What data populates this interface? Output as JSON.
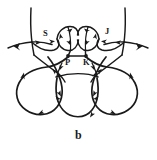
{
  "figure": {
    "caption": "b",
    "background_color": "#ffffff",
    "ink_color": "#1a1a1a",
    "type": "hand-drawn oriented link / curve diagram",
    "labels": [
      {
        "id": "label-s",
        "text": "S",
        "x": 45,
        "y": 34
      },
      {
        "id": "label-j",
        "text": "J",
        "x": 106,
        "y": 32
      },
      {
        "id": "label-p",
        "text": "P",
        "x": 66,
        "y": 58
      },
      {
        "id": "label-k",
        "text": "K",
        "x": 83,
        "y": 58
      }
    ],
    "marked_points": [
      {
        "id": "point-p",
        "label": "P",
        "cx": 68,
        "cy": 56
      },
      {
        "id": "point-k",
        "label": "K",
        "cx": 86,
        "cy": 56
      }
    ],
    "regions": [
      {
        "id": "lens-left",
        "note": "left lens-shaped bigon with interior arrows"
      },
      {
        "id": "lens-right",
        "note": "right lens-shaped bigon with interior arrows"
      },
      {
        "id": "loop-left",
        "note": "large left teardrop loop"
      },
      {
        "id": "loop-center",
        "note": "center bottom loop"
      },
      {
        "id": "loop-right",
        "note": "large right teardrop loop"
      }
    ],
    "arrow_count": 24
  }
}
